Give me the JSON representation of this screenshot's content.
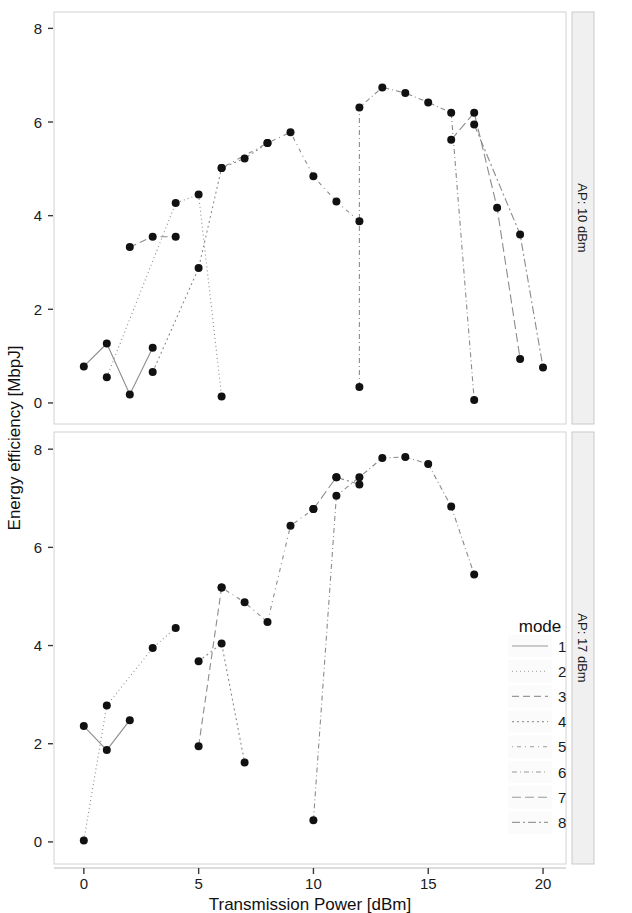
{
  "figure": {
    "xlabel": "Transmission Power [dBm]",
    "ylabel": "Energy efficiency [MbpJ]",
    "x_ticks": [
      "0",
      "5",
      "10",
      "15",
      "20"
    ],
    "y_ticks": [
      "0",
      "2",
      "4",
      "6",
      "8"
    ],
    "strip_top": "AP: 10 dBm",
    "strip_bottom": "AP: 17 dBm"
  },
  "legend": {
    "title": "mode",
    "items": [
      {
        "label": "1",
        "dash": "none"
      },
      {
        "label": "2",
        "dash": "1,3"
      },
      {
        "label": "3",
        "dash": "7,4"
      },
      {
        "label": "4",
        "dash": "2,3"
      },
      {
        "label": "5",
        "dash": "1,4,4,4"
      },
      {
        "label": "6",
        "dash": "5,3,1,3"
      },
      {
        "label": "7",
        "dash": "9,4"
      },
      {
        "label": "8",
        "dash": "8,3,2,3"
      }
    ]
  },
  "chart_data": {
    "type": "scatter",
    "title": "",
    "xlabel": "Transmission Power [dBm]",
    "ylabel": "Energy efficiency [MbpJ]",
    "xlim": [
      -1.3,
      21.0
    ],
    "ylim": [
      -0.45,
      8.35
    ],
    "grid": false,
    "legend_position": "right",
    "facets": [
      {
        "name": "AP: 10 dBm",
        "series": [
          {
            "name": "1",
            "dash": "none",
            "x": [
              0,
              1,
              2,
              3
            ],
            "y": [
              0.78,
              1.27,
              0.18,
              1.18
            ]
          },
          {
            "name": "2",
            "dash": "1,3",
            "x": [
              1,
              4,
              5,
              6
            ],
            "y": [
              0.55,
              4.27,
              4.45,
              0.14
            ]
          },
          {
            "name": "3",
            "dash": "7,4",
            "x": [
              2,
              3,
              4
            ],
            "y": [
              3.33,
              3.55,
              3.55
            ]
          },
          {
            "name": "4",
            "dash": "2,3",
            "x": [
              3,
              5,
              6,
              7,
              8
            ],
            "y": [
              0.66,
              2.88,
              5.02,
              5.22,
              5.55
            ]
          },
          {
            "name": "5",
            "dash": "1,4,4,4",
            "x": [
              6,
              8,
              9,
              10,
              11,
              12
            ],
            "y": [
              5.02,
              5.55,
              5.78,
              4.84,
              4.3,
              3.88
            ]
          },
          {
            "name": "6",
            "dash": "5,3,1,3",
            "x": [
              12,
              12,
              13,
              14,
              15,
              16,
              17
            ],
            "y": [
              0.34,
              6.31,
              6.74,
              6.62,
              6.42,
              6.2,
              0.06
            ]
          },
          {
            "name": "7",
            "dash": "9,4",
            "x": [
              16,
              17,
              18,
              19
            ],
            "y": [
              5.62,
              6.2,
              4.17,
              0.94
            ]
          },
          {
            "name": "8",
            "dash": "8,3,2,3",
            "x": [
              17,
              19,
              20
            ],
            "y": [
              5.95,
              3.6,
              0.76
            ]
          }
        ]
      },
      {
        "name": "AP: 17 dBm",
        "series": [
          {
            "name": "1",
            "dash": "none",
            "x": [
              0,
              1,
              2
            ],
            "y": [
              2.36,
              1.87,
              2.48
            ]
          },
          {
            "name": "2",
            "dash": "1,3",
            "x": [
              0,
              1,
              3,
              4
            ],
            "y": [
              0.03,
              2.78,
              3.95,
              4.36
            ]
          },
          {
            "name": "3",
            "dash": "7,4",
            "x": [
              5,
              6
            ],
            "y": [
              1.95,
              5.18
            ]
          },
          {
            "name": "4",
            "dash": "2,3",
            "x": [
              5,
              6,
              7
            ],
            "y": [
              3.68,
              4.04,
              1.62
            ]
          },
          {
            "name": "5",
            "dash": "1,4,4,4",
            "x": [
              6,
              7,
              8,
              9,
              10
            ],
            "y": [
              5.18,
              4.88,
              4.48,
              6.44,
              6.78
            ]
          },
          {
            "name": "6",
            "dash": "5,3,1,3",
            "x": [
              10,
              11,
              12,
              13,
              14,
              15,
              16,
              17
            ],
            "y": [
              0.44,
              7.05,
              7.43,
              7.82,
              7.84,
              7.7,
              6.83,
              5.45
            ]
          },
          {
            "name": "7",
            "dash": "9,4",
            "x": [
              10,
              11
            ],
            "y": [
              6.78,
              7.43
            ]
          },
          {
            "name": "8",
            "dash": "8,3,2,3",
            "x": [
              11,
              12
            ],
            "y": [
              7.43,
              7.28
            ]
          }
        ]
      }
    ]
  }
}
